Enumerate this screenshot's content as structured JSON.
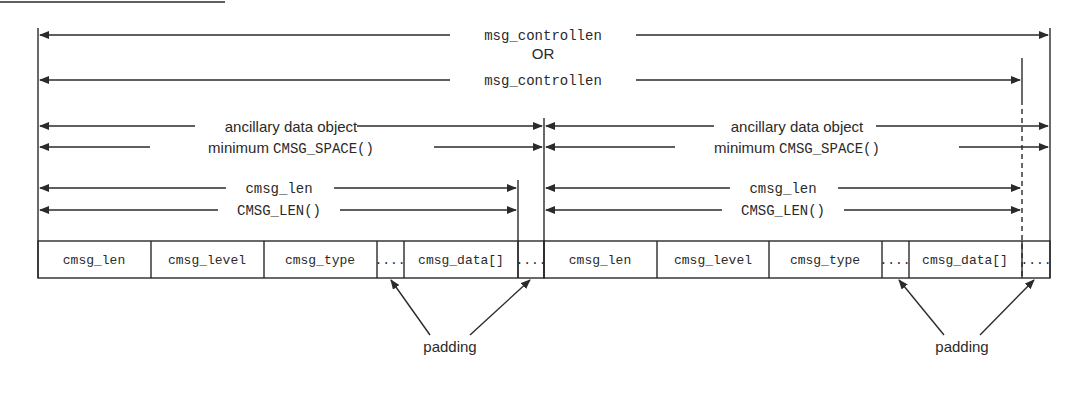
{
  "diagram": {
    "title_rule": true,
    "top": {
      "label_1": "msg_controllen",
      "or_label": "OR",
      "label_2": "msg_controllen"
    },
    "objects": [
      {
        "object_label": "ancillary data object",
        "space_prefix": "minimum ",
        "space_fn": "CMSG_SPACE()",
        "len_label": "cmsg_len",
        "len_fn": "CMSG_LEN()",
        "cells": [
          "cmsg_len",
          "cmsg_level",
          "cmsg_type",
          "....",
          "cmsg_data[]",
          "...."
        ],
        "padding_label": "padding"
      },
      {
        "object_label": "ancillary data object",
        "space_prefix": "minimum ",
        "space_fn": "CMSG_SPACE()",
        "len_label": "cmsg_len",
        "len_fn": "CMSG_LEN()",
        "cells": [
          "cmsg_len",
          "cmsg_level",
          "cmsg_type",
          "....",
          "cmsg_data[]",
          "...."
        ],
        "padding_label": "padding"
      }
    ],
    "colors": {
      "ink": "#2a2a2a",
      "background": "#ffffff"
    }
  }
}
